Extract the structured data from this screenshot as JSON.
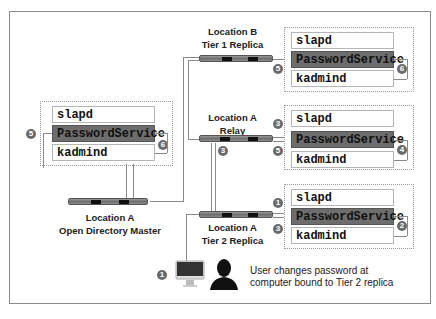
{
  "nodes": {
    "master": {
      "label_line1": "Location A",
      "label_line2": "Open Directory Master"
    },
    "tier1": {
      "label_line1": "Location B",
      "label_line2": "Tier 1 Replica"
    },
    "relay": {
      "label_line1": "Location A",
      "label_line2": "Relay"
    },
    "tier2": {
      "label_line1": "Location A",
      "label_line2": "Tier 2 Replica"
    }
  },
  "services": {
    "slapd": "slapd",
    "password": "PasswordService",
    "kadmind": "kadmind"
  },
  "badges": {
    "master_in": "5",
    "master_loop": "6",
    "tier1_in": "5",
    "tier1_loop": "6",
    "relay_in": "3",
    "relay_out": "5",
    "relay_loop": "4",
    "relay_up": "3",
    "tier2_in": "1",
    "tier2_out": "3",
    "tier2_loop": "2",
    "user": "1"
  },
  "caption": {
    "line1": "User changes password at",
    "line2": "computer bound to Tier 2 replica"
  },
  "colors": {
    "highlight": "#6d6d6d",
    "badge": "#6a6a6a",
    "line": "#8a8a8a"
  }
}
